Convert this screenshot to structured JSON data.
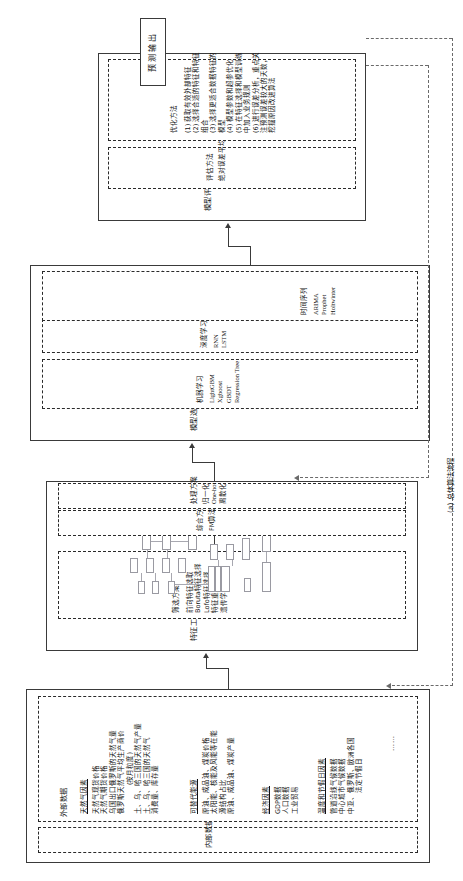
{
  "figure": {
    "caption": "(a) 总体算法流程",
    "ellipsis": "……"
  },
  "output_node": {
    "label": "预测输出"
  },
  "stages": {
    "data": {
      "title_internal": "内部数据",
      "title_external": "外部数据",
      "groups": [
        {
          "header": "天然气因素",
          "items": [
            "天然气现货价格",
            "天然气期货价格",
            "乌国出口俄罗斯的天然气量",
            "俄罗斯天然气平均生产商价",
            "(按月粒度)",
            "土、乌、哈三国的天然气产量",
            "土、乌、哈三国的天然气",
            "消费量、库存量"
          ]
        },
        {
          "header": "可替代能源",
          "items": [
            "原油、成品油、煤炭价格",
            "太阳能、核能及风能等在能",
            "源结构占比",
            "原油、成品油、煤炭产量"
          ]
        },
        {
          "header": "经济因素",
          "items": [
            "GDP数据",
            "人口数据",
            "工业贸易"
          ]
        },
        {
          "header": "温度和节假日因素",
          "items": [
            "管道沿线气候数据",
            "中心城市气候数据",
            "中亚、俄罗斯、欧洲各国",
            "法定节假日"
          ]
        }
      ]
    },
    "feature": {
      "title": "特征工程",
      "blocks": [
        {
          "header": "筛选方案",
          "items": [
            "前向特征选取",
            "Boruta特征选择",
            "Lofo特征选择",
            "特征重要性",
            "遗传学方法"
          ]
        },
        {
          "header": "综合方案",
          "items": [
            "FM算法"
          ]
        },
        {
          "header": "处理方案",
          "items": [
            "归一化",
            "One-hot",
            "离散化"
          ]
        }
      ]
    },
    "model": {
      "title": "模型选择&构建",
      "blocks": [
        {
          "header": "机器学习",
          "items": [
            "LightGBM",
            "Xgboost",
            "GBDT",
            "Regression Tree"
          ]
        },
        {
          "header": "深度学习",
          "items": [
            "RNN",
            "LSTM"
          ]
        },
        {
          "header": "时间序列",
          "items": [
            "ARIMA",
            "Prophet",
            "Holtwinter"
          ]
        }
      ]
    },
    "evaluation": {
      "title": "模型评估&优化",
      "blocks": [
        {
          "header": "评估方法",
          "items": [
            "绝对误差平均值"
          ]
        },
        {
          "header": "优化方法",
          "items": [
            "(1) 获取有效外部特征",
            "(2) 选择合适的特征和特征",
            "组合",
            "(3) 选择更适合数据特征的",
            "模型",
            "(4) 模型参数和超参优化",
            "(5) 在特征选择和模型训练",
            "中加入业务规则",
            "(6) 进行误差分析，重点关",
            "注预测误差较大的天数，",
            "挖掘原因改进算法"
          ]
        }
      ]
    }
  }
}
